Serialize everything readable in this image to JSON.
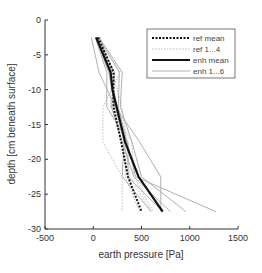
{
  "chart_data": {
    "type": "line",
    "title": "",
    "xlabel": "earth pressure [Pa]",
    "ylabel": "depth [cm beneath surface]",
    "xlim": [
      -500,
      1500
    ],
    "ylim": [
      -30,
      0
    ],
    "xticks": [
      -500,
      0,
      500,
      1000,
      1500
    ],
    "yticks": [
      0,
      -5,
      -10,
      -15,
      -20,
      -25,
      -30
    ],
    "xtick_labels": [
      "-500",
      "0",
      "500",
      "1000",
      "1500"
    ],
    "ytick_labels": [
      "0",
      "-5",
      "-10",
      "-15",
      "-20",
      "-25",
      "-30"
    ],
    "grid": false,
    "legend_position": "upper right",
    "series": [
      {
        "name": "ref mean",
        "style": "dotted",
        "color": "#111111",
        "width": 2,
        "x": [
          50,
          210,
          210,
          290,
          360,
          500
        ],
        "y": [
          -2.5,
          -7.5,
          -12.5,
          -17.5,
          -22.5,
          -27.5
        ]
      },
      {
        "name": "ref 1...4",
        "style": "dotted",
        "color": "#bbbbbb",
        "width": 1,
        "x": [
          60,
          280,
          100,
          100,
          300,
          300
        ],
        "y": [
          -2.5,
          -7.5,
          -12.5,
          -17.5,
          -22.5,
          -27.5
        ]
      },
      {
        "name": "ref 1...4",
        "style": "dotted",
        "color": "#bbbbbb",
        "width": 1,
        "x": [
          40,
          200,
          300,
          340,
          330,
          480
        ],
        "y": [
          -2.5,
          -7.5,
          -12.5,
          -17.5,
          -22.5,
          -27.5
        ]
      },
      {
        "name": "ref 1...4",
        "style": "dotted",
        "color": "#bbbbbb",
        "width": 1,
        "x": [
          70,
          170,
          250,
          320,
          380,
          600
        ],
        "y": [
          -2.5,
          -7.5,
          -12.5,
          -17.5,
          -22.5,
          -27.5
        ]
      },
      {
        "name": "ref 1...4",
        "style": "dotted",
        "color": "#bbbbbb",
        "width": 1,
        "x": [
          30,
          190,
          180,
          400,
          420,
          620
        ],
        "y": [
          -2.5,
          -7.5,
          -12.5,
          -17.5,
          -22.5,
          -27.5
        ]
      },
      {
        "name": "enh mean",
        "style": "solid",
        "color": "#111111",
        "width": 2.2,
        "x": [
          30,
          180,
          200,
          330,
          470,
          720
        ],
        "y": [
          -2.5,
          -7.5,
          -10,
          -17.5,
          -22.5,
          -27.5
        ]
      },
      {
        "name": "enh 1...6",
        "style": "solid",
        "color": "#b0b0b0",
        "width": 1,
        "x": [
          -20,
          60,
          230,
          480,
          700,
          700
        ],
        "y": [
          -2.5,
          -7.5,
          -12.5,
          -17.5,
          -22.5,
          -27.5
        ]
      },
      {
        "name": "enh 1...6",
        "style": "solid",
        "color": "#b0b0b0",
        "width": 1,
        "x": [
          20,
          140,
          140,
          360,
          360,
          720
        ],
        "y": [
          -2.5,
          -7.5,
          -12.5,
          -17.5,
          -22.5,
          -27.5
        ]
      },
      {
        "name": "enh 1...6",
        "style": "solid",
        "color": "#b0b0b0",
        "width": 1,
        "x": [
          50,
          270,
          260,
          350,
          440,
          1270
        ],
        "y": [
          -2.5,
          -7.5,
          -12.5,
          -17.5,
          -22.5,
          -27.5
        ]
      },
      {
        "name": "enh 1...6",
        "style": "solid",
        "color": "#b0b0b0",
        "width": 1,
        "x": [
          40,
          220,
          190,
          300,
          420,
          800
        ],
        "y": [
          -2.5,
          -7.5,
          -12.5,
          -17.5,
          -22.5,
          -27.5
        ]
      },
      {
        "name": "enh 1...6",
        "style": "solid",
        "color": "#b0b0b0",
        "width": 1,
        "x": [
          30,
          160,
          230,
          320,
          300,
          600
        ],
        "y": [
          -2.5,
          -7.5,
          -12.5,
          -17.5,
          -22.5,
          -27.5
        ]
      },
      {
        "name": "enh 1...6",
        "style": "solid",
        "color": "#b0b0b0",
        "width": 1,
        "x": [
          60,
          300,
          280,
          400,
          500,
          960
        ],
        "y": [
          -2.5,
          -7.5,
          -12.5,
          -17.5,
          -22.5,
          -27.5
        ]
      }
    ],
    "legend": [
      {
        "label": "ref mean",
        "style": "dotted",
        "color": "#111111",
        "width": 2
      },
      {
        "label": "ref 1...4",
        "style": "dotted",
        "color": "#bbbbbb",
        "width": 1
      },
      {
        "label": "enh mean",
        "style": "solid",
        "color": "#111111",
        "width": 2.2
      },
      {
        "label": "enh 1...6",
        "style": "solid",
        "color": "#b0b0b0",
        "width": 1
      }
    ]
  }
}
